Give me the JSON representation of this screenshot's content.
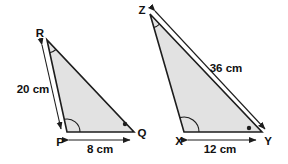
{
  "colors": {
    "background": "#ffffff",
    "triangle_fill": "#e2e2e2",
    "line": "#1d1d1d",
    "text": "#111111"
  },
  "left_triangle": {
    "vertex_top_label": "R",
    "vertex_bottom_left_label": "P",
    "vertex_bottom_right_label": "Q",
    "slant_side_label": "20 cm",
    "base_side_label": "8 cm",
    "angle_marks": {
      "top": "arc",
      "bottom_left": "arc",
      "bottom_right": "dot"
    }
  },
  "right_triangle": {
    "vertex_top_label": "Z",
    "vertex_bottom_left_label": "X",
    "vertex_bottom_right_label": "Y",
    "slant_side_label": "36 cm",
    "base_side_label": "12 cm",
    "angle_marks": {
      "top": "arc",
      "bottom_left": "arc",
      "bottom_right": "dot"
    }
  }
}
